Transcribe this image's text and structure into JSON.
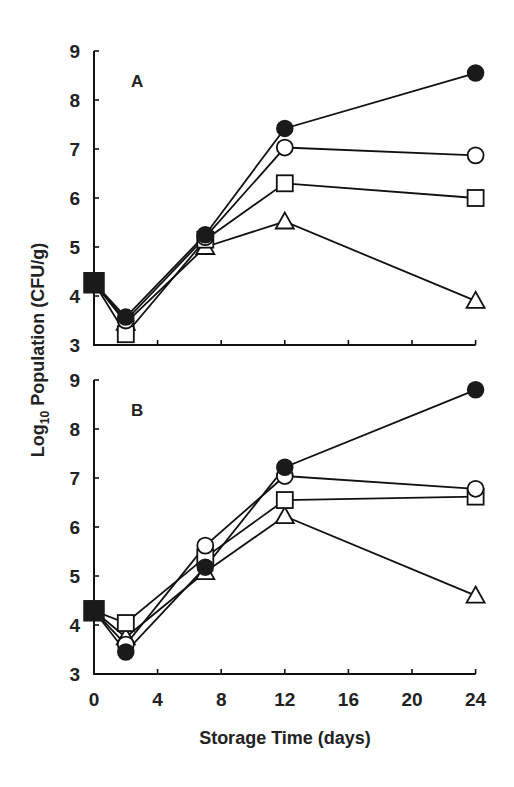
{
  "chart_data": [
    {
      "type": "line",
      "panel_label": "A",
      "x": [
        0,
        2,
        7,
        12,
        24
      ],
      "xlabel": "Storage Time (days)",
      "ylabel": "Log10 Population (CFU/g)",
      "xlim": [
        0,
        24
      ],
      "ylim": [
        3,
        9
      ],
      "xticks": [
        0,
        4,
        8,
        12,
        16,
        20,
        24
      ],
      "yticks": [
        3,
        4,
        5,
        6,
        7,
        8,
        9
      ],
      "grid": false,
      "legend": "none",
      "initial_point": {
        "x": 0,
        "y": 4.27,
        "marker": "filled-square"
      },
      "series": [
        {
          "name": "filled circle",
          "marker": "filled-circle",
          "values": [
            4.27,
            3.57,
            5.25,
            7.42,
            8.55
          ]
        },
        {
          "name": "open circle",
          "marker": "open-circle",
          "values": [
            4.27,
            3.5,
            5.2,
            7.03,
            6.87
          ]
        },
        {
          "name": "open square",
          "marker": "open-square",
          "values": [
            4.27,
            3.22,
            5.15,
            6.3,
            6.0
          ]
        },
        {
          "name": "open triangle",
          "marker": "open-triangle",
          "values": [
            4.27,
            3.45,
            5.0,
            5.52,
            3.9
          ]
        }
      ]
    },
    {
      "type": "line",
      "panel_label": "B",
      "x": [
        0,
        2,
        7,
        12,
        24
      ],
      "xlabel": "Storage Time (days)",
      "ylabel": "Log10 Population (CFU/g)",
      "xlim": [
        0,
        24
      ],
      "ylim": [
        3,
        9
      ],
      "xticks": [
        0,
        4,
        8,
        12,
        16,
        20,
        24
      ],
      "yticks": [
        3,
        4,
        5,
        6,
        7,
        8,
        9
      ],
      "grid": false,
      "legend": "none",
      "initial_point": {
        "x": 0,
        "y": 4.29,
        "marker": "filled-square"
      },
      "series": [
        {
          "name": "filled circle",
          "marker": "filled-circle",
          "values": [
            4.29,
            3.45,
            5.18,
            7.22,
            8.8
          ]
        },
        {
          "name": "open circle",
          "marker": "open-circle",
          "values": [
            4.29,
            3.6,
            5.62,
            7.04,
            6.78
          ]
        },
        {
          "name": "open square",
          "marker": "open-square",
          "values": [
            4.29,
            4.04,
            5.38,
            6.55,
            6.62
          ]
        },
        {
          "name": "open triangle",
          "marker": "open-triangle",
          "values": [
            4.29,
            3.75,
            5.08,
            6.22,
            4.6
          ]
        }
      ]
    }
  ],
  "axes": {
    "ylabel_main": "Log",
    "ylabel_sub": "10",
    "ylabel_rest": " Population (CFU/g)",
    "xlabel": "Storage Time (days)"
  }
}
